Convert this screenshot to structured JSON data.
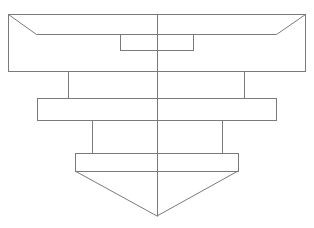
{
  "diagram": {
    "title": "",
    "stroke_color": "#7a7a7a",
    "background": "#ffffff",
    "parts": [
      {
        "id": "top-flange",
        "shape": "rect",
        "x": 8,
        "y": 14,
        "w": 297,
        "h": 57
      },
      {
        "id": "top-flange-chamfer-left",
        "shape": "line",
        "x1": 8,
        "y1": 14,
        "x2": 36,
        "y2": 34
      },
      {
        "id": "top-flange-chamfer-right",
        "shape": "line",
        "x1": 305,
        "y1": 14,
        "x2": 276,
        "y2": 34
      },
      {
        "id": "top-flange-inner-line",
        "shape": "line",
        "x1": 36,
        "y1": 34,
        "x2": 276,
        "y2": 34
      },
      {
        "id": "top-recess",
        "shape": "rect",
        "x": 120,
        "y": 34,
        "w": 73,
        "h": 16
      },
      {
        "id": "upper-body",
        "shape": "rect",
        "x": 68,
        "y": 71,
        "w": 176,
        "h": 27
      },
      {
        "id": "middle-flange",
        "shape": "rect",
        "x": 37,
        "y": 98,
        "w": 239,
        "h": 22
      },
      {
        "id": "lower-body",
        "shape": "rect",
        "x": 92,
        "y": 120,
        "w": 130,
        "h": 33
      },
      {
        "id": "bottom-flange",
        "shape": "rect",
        "x": 75,
        "y": 153,
        "w": 163,
        "h": 18
      },
      {
        "id": "cone-tip",
        "shape": "polyline",
        "points": "75,171 157,216 238,171"
      },
      {
        "id": "center-axis",
        "shape": "line",
        "x1": 157,
        "y1": 14,
        "x2": 157,
        "y2": 216
      }
    ]
  }
}
